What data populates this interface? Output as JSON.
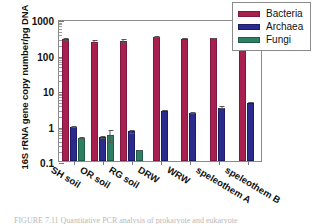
{
  "chart_data": {
    "type": "bar",
    "title": "",
    "xlabel": "",
    "ylabel": "16S rRNA gene copy number/pg DNA",
    "yscale": "log",
    "ylim": [
      0.1,
      1000
    ],
    "ytick_labels": [
      "1000",
      "100",
      "10",
      "1",
      "0.1"
    ],
    "ytick_values": [
      1000,
      100,
      10,
      1,
      0.1
    ],
    "grid": false,
    "legend_position": "top-right",
    "categories": [
      "SH soil",
      "OR soil",
      "RG soil",
      "DRW",
      "WRW",
      "speleothem A",
      "speleothem B"
    ],
    "series": [
      {
        "name": "Bacteria",
        "color": "#a82050",
        "values": [
          265,
          225,
          240,
          310,
          280,
          285,
          430
        ],
        "errors": [
          18,
          30,
          28,
          12,
          10,
          9,
          14
        ]
      },
      {
        "name": "Archaea",
        "color": "#2b2b8e",
        "values": [
          0.9,
          0.46,
          0.68,
          2.6,
          2.25,
          3.2,
          4.4
        ],
        "errors": [
          0.07,
          0.04,
          0.09,
          0.1,
          0.06,
          0.25,
          0.12
        ]
      },
      {
        "name": "Fungi",
        "color": "#2d8062",
        "values": [
          0.45,
          0.53,
          0.2,
          null,
          null,
          null,
          null
        ],
        "errors": [
          0.03,
          0.2,
          0.01,
          null,
          null,
          null,
          null
        ]
      }
    ]
  },
  "legend": {
    "items": [
      {
        "label": "Bacteria",
        "swatch": "bacteria"
      },
      {
        "label": "Archaea",
        "swatch": "archaea"
      },
      {
        "label": "Fungi",
        "swatch": "fungi"
      }
    ]
  },
  "caption": {
    "text": "FIGURE 7.11   Quantitative PCR analysis of prokaryote and eukaryote"
  }
}
